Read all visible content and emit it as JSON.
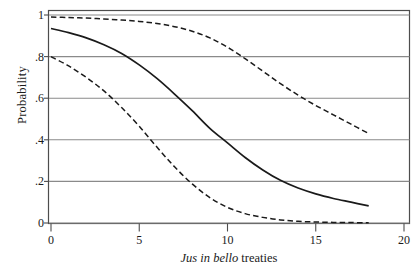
{
  "chart_data": {
    "type": "line",
    "title": "",
    "xlabel": "Jus in bello treaties",
    "xlabel_italic_part": "Jus in bello",
    "xlabel_roman_part": "treaties",
    "ylabel": "Probability",
    "xlim": [
      0,
      20
    ],
    "ylim": [
      0,
      1
    ],
    "xticks": [
      0,
      5,
      10,
      15,
      20
    ],
    "xtick_labels": [
      "0",
      "5",
      "10",
      "15",
      "20"
    ],
    "yticks": [
      0,
      0.2,
      0.4,
      0.6,
      0.8,
      1
    ],
    "ytick_labels": [
      "0",
      ".2",
      ".4",
      ".6",
      ".8",
      "1"
    ],
    "grid": "horizontal",
    "legend": "none",
    "line_color": "#1a1a1a",
    "grid_color": "#8a8a8a",
    "frame_color": "#4d4d4d",
    "series": [
      {
        "name": "upper-confidence-bound",
        "style": "dashed",
        "x": [
          0,
          1,
          2,
          3,
          4,
          5,
          6,
          7,
          8,
          9,
          10,
          11,
          12,
          13,
          14,
          15,
          16,
          17,
          18
        ],
        "values": [
          0.99,
          0.988,
          0.985,
          0.981,
          0.976,
          0.969,
          0.959,
          0.944,
          0.922,
          0.89,
          0.845,
          0.79,
          0.73,
          0.67,
          0.615,
          0.565,
          0.52,
          0.475,
          0.43
        ]
      },
      {
        "name": "point-estimate",
        "style": "solid",
        "x": [
          0,
          1,
          2,
          3,
          4,
          5,
          6,
          7,
          8,
          9,
          10,
          11,
          12,
          13,
          14,
          15,
          16,
          17,
          18
        ],
        "values": [
          0.935,
          0.915,
          0.89,
          0.857,
          0.815,
          0.76,
          0.695,
          0.62,
          0.54,
          0.455,
          0.385,
          0.315,
          0.255,
          0.205,
          0.168,
          0.14,
          0.118,
          0.1,
          0.082
        ]
      },
      {
        "name": "lower-confidence-bound",
        "style": "dashed",
        "x": [
          0,
          1,
          2,
          3,
          4,
          5,
          6,
          7,
          8,
          9,
          10,
          11,
          12,
          13,
          14,
          15,
          16,
          17,
          18
        ],
        "values": [
          0.8,
          0.755,
          0.7,
          0.635,
          0.555,
          0.465,
          0.365,
          0.27,
          0.188,
          0.122,
          0.075,
          0.045,
          0.027,
          0.015,
          0.008,
          0.005,
          0.003,
          0.002,
          0.001
        ]
      }
    ]
  },
  "axes": {
    "ylabel": "Probability",
    "xlabel_italic": "Jus in bello",
    "xlabel_roman": " treaties"
  },
  "ticks": {
    "y": [
      {
        "label": "1"
      },
      {
        "label": ".8"
      },
      {
        "label": ".6"
      },
      {
        "label": ".4"
      },
      {
        "label": ".2"
      },
      {
        "label": "0"
      }
    ],
    "x": [
      {
        "label": "0"
      },
      {
        "label": "5"
      },
      {
        "label": "10"
      },
      {
        "label": "15"
      },
      {
        "label": "20"
      }
    ]
  }
}
